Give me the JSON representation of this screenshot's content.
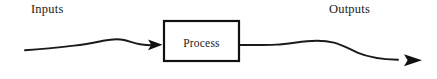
{
  "diagram": {
    "type": "process-flow",
    "background_color": "#ffffff",
    "stroke_color": "#1a1a1a",
    "labels": {
      "inputs": "Inputs",
      "outputs": "Outputs"
    },
    "process_box": {
      "label": "Process",
      "x": 163,
      "y": 20,
      "width": 77,
      "height": 42,
      "border_width": 2,
      "border_color": "#111111",
      "fill": "#ffffff"
    },
    "input_flow": {
      "name": "input-flow-arrow",
      "start_x": 25,
      "start_y": 50,
      "end_x": 163,
      "end_y": 45,
      "style": "wavy",
      "arrowhead": "solid-triangle"
    },
    "output_flow": {
      "name": "output-flow-arrow",
      "start_x": 240,
      "start_y": 45,
      "end_x": 422,
      "end_y": 60,
      "style": "wavy",
      "arrowhead": "solid-triangle"
    }
  }
}
